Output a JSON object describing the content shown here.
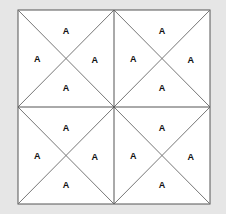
{
  "diagram": {
    "outer": {
      "x": 18,
      "y": 10,
      "w": 192,
      "h": 194
    },
    "grid": {
      "rows": 2,
      "cols": 2
    },
    "colors": {
      "background": "#e6e6e6",
      "fill": "#ffffff",
      "line": "#777777",
      "border": "#555555"
    },
    "cells": [
      {
        "labels": [
          "A",
          "A",
          "A",
          "A"
        ]
      },
      {
        "labels": [
          "A",
          "A",
          "A",
          "A"
        ]
      },
      {
        "labels": [
          "A",
          "A",
          "A",
          "A"
        ]
      },
      {
        "labels": [
          "A",
          "A",
          "A",
          "A"
        ]
      }
    ]
  }
}
